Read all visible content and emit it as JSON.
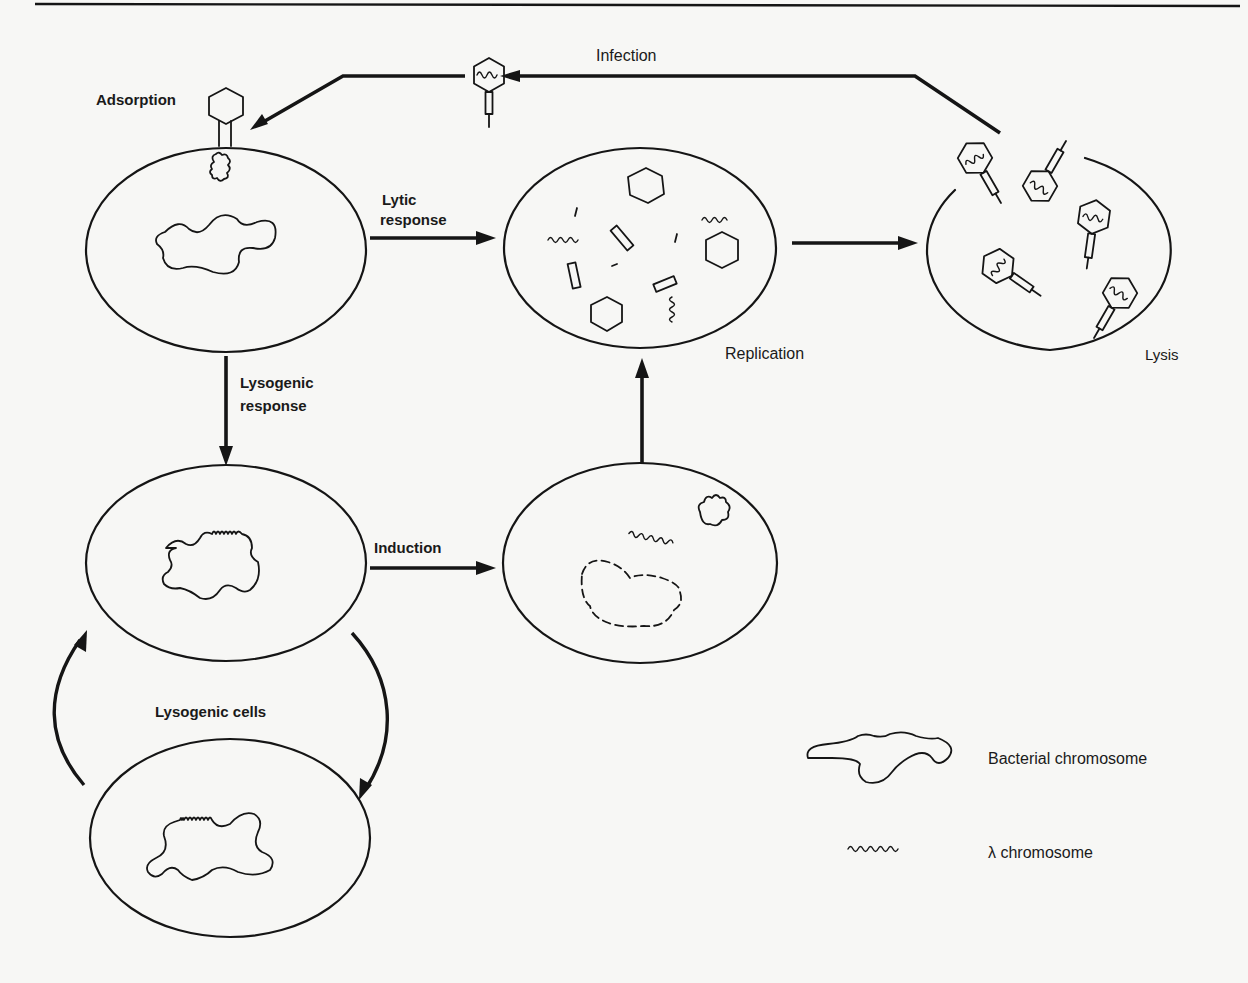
{
  "diagram": {
    "labels": {
      "infection": "Infection",
      "adsorption": "Adsorption",
      "lytic_response_line1": "Lytic",
      "lytic_response_line2": "response",
      "replication": "Replication",
      "lysis": "Lysis",
      "lysogenic_response_line1": "Lysogenic",
      "lysogenic_response_line2": "response",
      "induction": "Induction",
      "lysogenic_cells": "Lysogenic cells"
    },
    "legend": {
      "items": [
        {
          "symbol": "bacterial-chromosome-icon",
          "label": "Bacterial chromosome"
        },
        {
          "symbol": "lambda-chromosome-icon",
          "label": "λ chromosome"
        }
      ]
    },
    "nodes": [
      {
        "id": "adsorbed-cell",
        "label": "Adsorption"
      },
      {
        "id": "replicating-cell",
        "label": "Replication"
      },
      {
        "id": "lysing-cell",
        "label": "Lysis"
      },
      {
        "id": "lysogen-cell",
        "label": ""
      },
      {
        "id": "induced-cell",
        "label": ""
      },
      {
        "id": "daughter-lysogen-cell",
        "label": ""
      }
    ],
    "edges": [
      {
        "from": "lysing-cell",
        "to": "adsorbed-cell",
        "label": "Infection"
      },
      {
        "from": "adsorbed-cell",
        "to": "replicating-cell",
        "label": "Lytic response"
      },
      {
        "from": "replicating-cell",
        "to": "lysing-cell",
        "label": ""
      },
      {
        "from": "adsorbed-cell",
        "to": "lysogen-cell",
        "label": "Lysogenic response"
      },
      {
        "from": "lysogen-cell",
        "to": "induced-cell",
        "label": "Induction"
      },
      {
        "from": "induced-cell",
        "to": "replicating-cell",
        "label": ""
      },
      {
        "from": "lysogen-cell",
        "to": "daughter-lysogen-cell",
        "label": "Lysogenic cells"
      },
      {
        "from": "daughter-lysogen-cell",
        "to": "lysogen-cell",
        "label": "Lysogenic cells"
      }
    ]
  }
}
